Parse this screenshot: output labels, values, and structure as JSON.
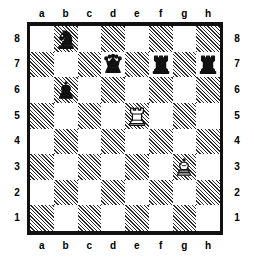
{
  "board": {
    "files": [
      "a",
      "b",
      "c",
      "d",
      "e",
      "f",
      "g",
      "h"
    ],
    "ranks": [
      "8",
      "7",
      "6",
      "5",
      "4",
      "3",
      "2",
      "1"
    ],
    "light_color": "#ffffff",
    "dark_color": "#2b2b2b",
    "border_color": "#111111",
    "orientation": "white-bottom",
    "squares": [
      [
        {
          "id": "a8",
          "shade": "light",
          "piece": null
        },
        {
          "id": "b8",
          "shade": "dark",
          "piece": {
            "type": "knight",
            "color": "black",
            "glyph": "♞",
            "name": "black-knight"
          }
        },
        {
          "id": "c8",
          "shade": "light",
          "piece": null
        },
        {
          "id": "d8",
          "shade": "dark",
          "piece": null
        },
        {
          "id": "e8",
          "shade": "light",
          "piece": null
        },
        {
          "id": "f8",
          "shade": "dark",
          "piece": null
        },
        {
          "id": "g8",
          "shade": "light",
          "piece": null
        },
        {
          "id": "h8",
          "shade": "dark",
          "piece": null
        }
      ],
      [
        {
          "id": "a7",
          "shade": "dark",
          "piece": null
        },
        {
          "id": "b7",
          "shade": "light",
          "piece": null
        },
        {
          "id": "c7",
          "shade": "dark",
          "piece": null
        },
        {
          "id": "d7",
          "shade": "light",
          "piece": {
            "type": "queen",
            "color": "black",
            "glyph": "♛",
            "name": "black-queen"
          }
        },
        {
          "id": "e7",
          "shade": "dark",
          "piece": null
        },
        {
          "id": "f7",
          "shade": "light",
          "piece": {
            "type": "rook",
            "color": "black",
            "glyph": "♜",
            "name": "black-rook"
          }
        },
        {
          "id": "g7",
          "shade": "dark",
          "piece": null
        },
        {
          "id": "h7",
          "shade": "light",
          "piece": {
            "type": "rook",
            "color": "black",
            "glyph": "♜",
            "name": "black-rook"
          }
        }
      ],
      [
        {
          "id": "a6",
          "shade": "light",
          "piece": null
        },
        {
          "id": "b6",
          "shade": "dark",
          "piece": {
            "type": "king",
            "color": "black",
            "glyph": "♚",
            "name": "black-king"
          }
        },
        {
          "id": "c6",
          "shade": "light",
          "piece": null
        },
        {
          "id": "d6",
          "shade": "dark",
          "piece": null
        },
        {
          "id": "e6",
          "shade": "light",
          "piece": null
        },
        {
          "id": "f6",
          "shade": "dark",
          "piece": null
        },
        {
          "id": "g6",
          "shade": "light",
          "piece": null
        },
        {
          "id": "h6",
          "shade": "dark",
          "piece": null
        }
      ],
      [
        {
          "id": "a5",
          "shade": "dark",
          "piece": null
        },
        {
          "id": "b5",
          "shade": "light",
          "piece": null
        },
        {
          "id": "c5",
          "shade": "dark",
          "piece": null
        },
        {
          "id": "d5",
          "shade": "light",
          "piece": null
        },
        {
          "id": "e5",
          "shade": "dark",
          "piece": {
            "type": "rook",
            "color": "white",
            "glyph": "♖",
            "name": "white-rook"
          }
        },
        {
          "id": "f5",
          "shade": "light",
          "piece": null
        },
        {
          "id": "g5",
          "shade": "dark",
          "piece": null
        },
        {
          "id": "h5",
          "shade": "light",
          "piece": null
        }
      ],
      [
        {
          "id": "a4",
          "shade": "light",
          "piece": null
        },
        {
          "id": "b4",
          "shade": "dark",
          "piece": null
        },
        {
          "id": "c4",
          "shade": "light",
          "piece": null
        },
        {
          "id": "d4",
          "shade": "dark",
          "piece": null
        },
        {
          "id": "e4",
          "shade": "light",
          "piece": null
        },
        {
          "id": "f4",
          "shade": "dark",
          "piece": null
        },
        {
          "id": "g4",
          "shade": "light",
          "piece": null
        },
        {
          "id": "h4",
          "shade": "dark",
          "piece": null
        }
      ],
      [
        {
          "id": "a3",
          "shade": "dark",
          "piece": null
        },
        {
          "id": "b3",
          "shade": "light",
          "piece": null
        },
        {
          "id": "c3",
          "shade": "dark",
          "piece": null
        },
        {
          "id": "d3",
          "shade": "light",
          "piece": null
        },
        {
          "id": "e3",
          "shade": "dark",
          "piece": null
        },
        {
          "id": "f3",
          "shade": "light",
          "piece": null
        },
        {
          "id": "g3",
          "shade": "dark",
          "piece": {
            "type": "king",
            "color": "white",
            "glyph": "♔",
            "name": "white-king"
          }
        },
        {
          "id": "h3",
          "shade": "light",
          "piece": null
        }
      ],
      [
        {
          "id": "a2",
          "shade": "light",
          "piece": null
        },
        {
          "id": "b2",
          "shade": "dark",
          "piece": null
        },
        {
          "id": "c2",
          "shade": "light",
          "piece": null
        },
        {
          "id": "d2",
          "shade": "dark",
          "piece": null
        },
        {
          "id": "e2",
          "shade": "light",
          "piece": null
        },
        {
          "id": "f2",
          "shade": "dark",
          "piece": null
        },
        {
          "id": "g2",
          "shade": "light",
          "piece": null
        },
        {
          "id": "h2",
          "shade": "dark",
          "piece": null
        }
      ],
      [
        {
          "id": "a1",
          "shade": "dark",
          "piece": null
        },
        {
          "id": "b1",
          "shade": "light",
          "piece": null
        },
        {
          "id": "c1",
          "shade": "dark",
          "piece": null
        },
        {
          "id": "d1",
          "shade": "light",
          "piece": null
        },
        {
          "id": "e1",
          "shade": "dark",
          "piece": null
        },
        {
          "id": "f1",
          "shade": "light",
          "piece": null
        },
        {
          "id": "g1",
          "shade": "dark",
          "piece": null
        },
        {
          "id": "h1",
          "shade": "light",
          "piece": null
        }
      ]
    ]
  }
}
